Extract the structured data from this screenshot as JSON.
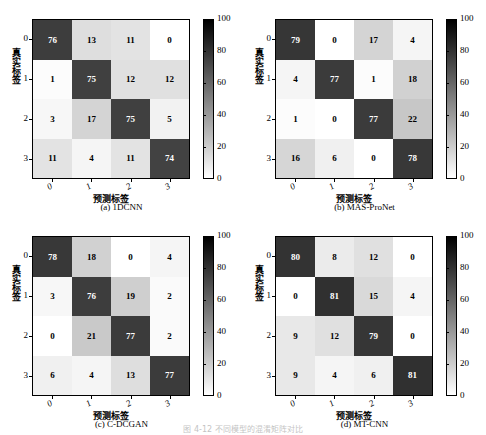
{
  "figure": {
    "caption": "图 4-12  不同模型的混淆矩阵对比",
    "background": "#ffffff"
  },
  "axes": {
    "ylabel": "真实标签",
    "xlabel": "预测标签",
    "ytick_labels": [
      "0",
      "1",
      "2",
      "3"
    ],
    "xtick_labels": [
      "0",
      "1",
      "2",
      "3"
    ]
  },
  "colorbar": {
    "ticks": [
      "100",
      "80",
      "60",
      "40",
      "20",
      "0"
    ],
    "vmin": 0,
    "vmax": 100,
    "low_color": "#ffffff",
    "high_color": "#000000"
  },
  "panels": [
    {
      "id": "a",
      "caption": "(a) 1DCNN"
    },
    {
      "id": "b",
      "caption": "(b) MAS-ProNet"
    },
    {
      "id": "c",
      "caption": "(c) C-DCGAN"
    },
    {
      "id": "d",
      "caption": "(d) MT-CNN"
    }
  ],
  "chart_data": [
    {
      "type": "heatmap",
      "title": "(a) 1DCNN",
      "xlabel": "预测标签",
      "ylabel": "真实标签",
      "xticklabels": [
        "0",
        "1",
        "2",
        "3"
      ],
      "yticklabels": [
        "0",
        "1",
        "2",
        "3"
      ],
      "vmin": 0,
      "vmax": 100,
      "colormap": "gray_r",
      "legend_position": "right",
      "grid": false,
      "values": [
        [
          76,
          13,
          11,
          0
        ],
        [
          1,
          75,
          12,
          12
        ],
        [
          3,
          17,
          75,
          5
        ],
        [
          11,
          4,
          11,
          74
        ]
      ]
    },
    {
      "type": "heatmap",
      "title": "(b) MAS-ProNet",
      "xlabel": "预测标签",
      "ylabel": "真实标签",
      "xticklabels": [
        "0",
        "1",
        "2",
        "3"
      ],
      "yticklabels": [
        "0",
        "1",
        "2",
        "3"
      ],
      "vmin": 0,
      "vmax": 100,
      "colormap": "gray_r",
      "legend_position": "right",
      "grid": false,
      "values": [
        [
          79,
          0,
          17,
          4
        ],
        [
          4,
          77,
          1,
          18
        ],
        [
          1,
          0,
          77,
          22
        ],
        [
          16,
          6,
          0,
          78
        ]
      ]
    },
    {
      "type": "heatmap",
      "title": "(c) C-DCGAN",
      "xlabel": "预测标签",
      "ylabel": "真实标签",
      "xticklabels": [
        "0",
        "1",
        "2",
        "3"
      ],
      "yticklabels": [
        "0",
        "1",
        "2",
        "3"
      ],
      "vmin": 0,
      "vmax": 100,
      "colormap": "gray_r",
      "legend_position": "right",
      "grid": false,
      "values": [
        [
          78,
          18,
          0,
          4
        ],
        [
          3,
          76,
          19,
          2
        ],
        [
          0,
          21,
          77,
          2
        ],
        [
          6,
          4,
          13,
          77
        ]
      ]
    },
    {
      "type": "heatmap",
      "title": "(d) MT-CNN",
      "xlabel": "预测标签",
      "ylabel": "真实标签",
      "xticklabels": [
        "0",
        "1",
        "2",
        "3"
      ],
      "yticklabels": [
        "0",
        "1",
        "2",
        "3"
      ],
      "vmin": 0,
      "vmax": 100,
      "colormap": "gray_r",
      "legend_position": "right",
      "grid": false,
      "values": [
        [
          80,
          8,
          12,
          0
        ],
        [
          0,
          81,
          15,
          4
        ],
        [
          9,
          12,
          79,
          0
        ],
        [
          9,
          4,
          6,
          81
        ]
      ]
    }
  ]
}
